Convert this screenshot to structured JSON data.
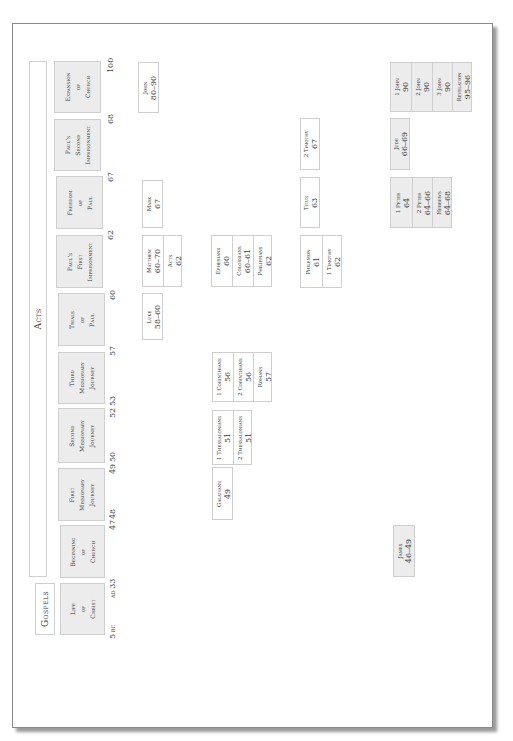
{
  "sections": {
    "gospels_label": "Gospels",
    "acts_label": "Acts"
  },
  "periods": [
    {
      "name": "Life of Christ",
      "lines": [
        "Life",
        "of",
        "Christ"
      ]
    },
    {
      "name": "Beginning of Church",
      "lines": [
        "Beginning",
        "of",
        "Church"
      ]
    },
    {
      "name": "First Missionary Journey",
      "lines": [
        "First",
        "Missionary",
        "Journey"
      ]
    },
    {
      "name": "Second Missionary Journey",
      "lines": [
        "Second",
        "Missionary",
        "Journey"
      ]
    },
    {
      "name": "Third Missionary Journey",
      "lines": [
        "Third",
        "Missionary",
        "Journey"
      ]
    },
    {
      "name": "Trials of Paul",
      "lines": [
        "Trials",
        "of",
        "Paul"
      ]
    },
    {
      "name": "Paul's First Imprisonment",
      "lines": [
        "Paul's",
        "First",
        "Imprisonment"
      ]
    },
    {
      "name": "Freedom of Paul",
      "lines": [
        "Freedom",
        "of",
        "Paul"
      ]
    },
    {
      "name": "Paul's Second Imprisonment",
      "lines": [
        "Paul's",
        "Second",
        "Imprisonment"
      ]
    },
    {
      "name": "Expansion of Church",
      "lines": [
        "Expansion",
        "of",
        "Church"
      ]
    }
  ],
  "timeline_ticks": [
    {
      "label": "5",
      "suffix": "BC"
    },
    {
      "prefix": "AD",
      "label": "33"
    },
    {
      "label": "47"
    },
    {
      "label": "48"
    },
    {
      "label": "49"
    },
    {
      "label": "50"
    },
    {
      "label": "52"
    },
    {
      "label": "53"
    },
    {
      "label": "57"
    },
    {
      "label": "60"
    },
    {
      "label": "62"
    },
    {
      "label": "67"
    },
    {
      "label": "68"
    },
    {
      "label": "100"
    }
  ],
  "books": {
    "john": {
      "name": "John",
      "date": "80–90"
    },
    "mark": {
      "name": "Mark",
      "date": "67"
    },
    "matthew": {
      "name": "Matthew",
      "date": "60–70"
    },
    "acts": {
      "name": "Acts",
      "date": "62"
    },
    "luke": {
      "name": "Luke",
      "date": "58–60"
    },
    "ephesians": {
      "name": "Ephesians",
      "date": "60"
    },
    "colossians": {
      "name": "Colossians",
      "date": "60–61"
    },
    "philippians": {
      "name": "Philippians",
      "date": "62"
    },
    "corinthians1": {
      "name": "1 Corinthians",
      "date": "56"
    },
    "corinthians2": {
      "name": "2 Corinthians",
      "date": "56"
    },
    "romans": {
      "name": "Romans",
      "date": "57"
    },
    "thessalonians1": {
      "name": "1 Thessalonians",
      "date": "51"
    },
    "thessalonians2": {
      "name": "2 Thessalonians",
      "date": "51"
    },
    "galatians": {
      "name": "Galatians",
      "date": "49"
    },
    "timothy2": {
      "name": "2 Timothy",
      "date": "67"
    },
    "titus": {
      "name": "Titus",
      "date": "63"
    },
    "philemon": {
      "name": "Philemon",
      "date": "61"
    },
    "timothy1": {
      "name": "1 Timothy",
      "date": "62"
    },
    "john1": {
      "name": "1 John",
      "date": "90"
    },
    "john2": {
      "name": "2 John",
      "date": "90"
    },
    "john3": {
      "name": "3 John",
      "date": "90"
    },
    "revelation": {
      "name": "Revelation",
      "date": "95–96"
    },
    "jude": {
      "name": "Jude",
      "date": "66–69"
    },
    "peter1": {
      "name": "1 Peter",
      "date": "64"
    },
    "peter2": {
      "name": "2 Peter",
      "date": "64–66"
    },
    "hebrews": {
      "name": "Hebrews",
      "date": "64–68"
    },
    "james": {
      "name": "James",
      "date": "46–49"
    }
  },
  "colors": {
    "period_fill": "#ececec",
    "general_epistle_fill": "#ececec",
    "box_border": "#cfcfcf",
    "text": "#3a3a3a"
  }
}
